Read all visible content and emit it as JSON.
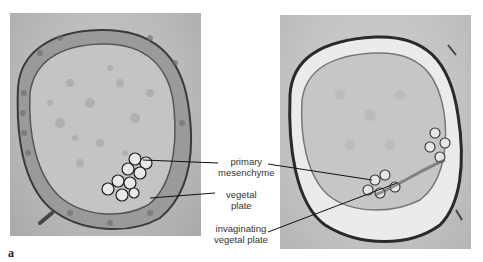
{
  "figure": {
    "panel_letter": "a",
    "labels": {
      "primary_mesenchyme": [
        "primary",
        "mesenchyme"
      ],
      "vegetal_plate": [
        "vegetal",
        "plate"
      ],
      "invaginating_vegetal_plate": [
        "invaginating",
        "vegetal plate"
      ]
    },
    "panels": [
      {
        "id": "left",
        "description": "micrograph of blastula with primary mesenchyme and vegetal plate"
      },
      {
        "id": "right",
        "description": "micrograph of embryo with invaginating vegetal plate"
      }
    ]
  }
}
